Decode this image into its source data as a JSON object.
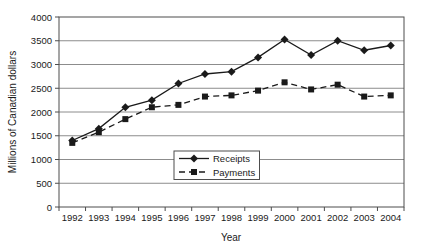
{
  "chart_data": {
    "type": "line",
    "title": "",
    "xlabel": "Year",
    "ylabel": "Millions of Canadian dollars",
    "categories": [
      "1992",
      "1993",
      "1994",
      "1995",
      "1996",
      "1997",
      "1998",
      "1999",
      "2000",
      "2001",
      "2002",
      "2003",
      "2004"
    ],
    "series": [
      {
        "name": "Receipts",
        "marker": "diamond",
        "line_style": "solid",
        "values": [
          1400,
          1650,
          2100,
          2250,
          2600,
          2800,
          2850,
          3150,
          3525,
          3200,
          3500,
          3300,
          3400
        ]
      },
      {
        "name": "Payments",
        "marker": "square",
        "line_style": "dashed",
        "values": [
          1350,
          1575,
          1850,
          2100,
          2150,
          2325,
          2350,
          2450,
          2625,
          2475,
          2575,
          2325,
          2350
        ]
      }
    ],
    "ylim": [
      0,
      4000
    ],
    "ytick_step": 500,
    "grid": "horizontal",
    "legend_position": "inside-bottom-center",
    "colors": {
      "series": "#1a1a1a",
      "gridline": "#8c8c8c",
      "axis": "#4d4d4d",
      "text": "#1a1a1a",
      "background": "#ffffff"
    }
  }
}
